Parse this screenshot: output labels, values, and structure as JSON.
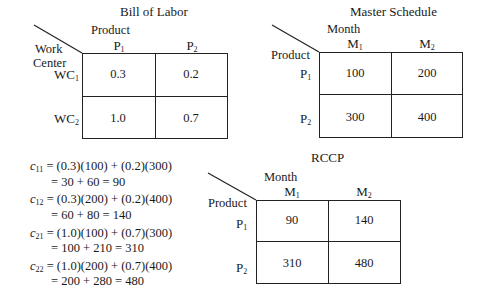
{
  "bill_of_labor": {
    "title": "Bill of Labor",
    "col_axis_label": "Product",
    "row_axis_label_line1": "Work",
    "row_axis_label_line2": "Center",
    "columns": [
      {
        "base": "P",
        "sub": "1"
      },
      {
        "base": "P",
        "sub": "2"
      }
    ],
    "rows": [
      {
        "base": "WC",
        "sub": "1"
      },
      {
        "base": "WC",
        "sub": "2"
      }
    ],
    "cells": [
      [
        "0.3",
        "0.2"
      ],
      [
        "1.0",
        "0.7"
      ]
    ]
  },
  "master_schedule": {
    "title": "Master Schedule",
    "col_axis_label": "Month",
    "row_axis_label": "Product",
    "columns": [
      {
        "base": "M",
        "sub": "1"
      },
      {
        "base": "M",
        "sub": "2"
      }
    ],
    "rows": [
      {
        "base": "P",
        "sub": "1"
      },
      {
        "base": "P",
        "sub": "2"
      }
    ],
    "cells": [
      [
        "100",
        "200"
      ],
      [
        "300",
        "400"
      ]
    ]
  },
  "rccp": {
    "title": "RCCP",
    "col_axis_label": "Month",
    "row_axis_label": "Product",
    "columns": [
      {
        "base": "M",
        "sub": "1"
      },
      {
        "base": "M",
        "sub": "2"
      }
    ],
    "rows": [
      {
        "base": "P",
        "sub": "1"
      },
      {
        "base": "P",
        "sub": "2"
      }
    ],
    "cells": [
      [
        "90",
        "140"
      ],
      [
        "310",
        "480"
      ]
    ]
  },
  "equations": [
    {
      "var": "c",
      "sub": "11",
      "line1": "= (0.3)(100) + (0.2)(300)",
      "line2": "= 30 + 60 = 90"
    },
    {
      "var": "c",
      "sub": "12",
      "line1": "= (0.3)(200) + (0.2)(400)",
      "line2": "= 60 + 80 = 140"
    },
    {
      "var": "c",
      "sub": "21",
      "line1": "= (1.0)(100) + (0.7)(300)",
      "line2": "= 100 + 210 = 310"
    },
    {
      "var": "c",
      "sub": "22",
      "line1": "= (1.0)(200) + (0.7)(400)",
      "line2": "= 200 + 280 = 480"
    }
  ]
}
